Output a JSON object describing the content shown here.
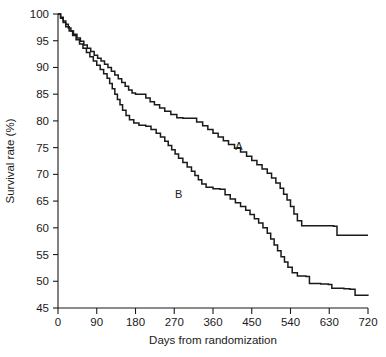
{
  "chart_data": {
    "type": "line",
    "title": "",
    "subtitle": "",
    "xlabel": "Days from randomization",
    "ylabel": "Survival rate (%)",
    "xlim": [
      0,
      720
    ],
    "ylim": [
      45,
      100
    ],
    "xticks": [
      0,
      90,
      180,
      270,
      360,
      450,
      540,
      630,
      720
    ],
    "yticks": [
      45,
      50,
      55,
      60,
      65,
      70,
      75,
      80,
      85,
      90,
      95,
      100
    ],
    "grid": false,
    "legend_position": "inline-annotation",
    "annotations": [
      {
        "text": "A",
        "x": 420,
        "y": 74.5
      },
      {
        "text": "B",
        "x": 280,
        "y": 65.5
      }
    ],
    "series": [
      {
        "name": "A",
        "label": "A",
        "style": "step-post",
        "color": "#1a1a1a",
        "points": [
          [
            0,
            100.0
          ],
          [
            6,
            99.4
          ],
          [
            12,
            98.7
          ],
          [
            18,
            98.1
          ],
          [
            24,
            97.4
          ],
          [
            30,
            96.8
          ],
          [
            36,
            96.2
          ],
          [
            44,
            95.5
          ],
          [
            52,
            94.9
          ],
          [
            60,
            94.2
          ],
          [
            68,
            93.6
          ],
          [
            76,
            93.0
          ],
          [
            84,
            92.3
          ],
          [
            92,
            91.7
          ],
          [
            100,
            91.2
          ],
          [
            108,
            90.6
          ],
          [
            116,
            90.0
          ],
          [
            124,
            89.3
          ],
          [
            132,
            88.6
          ],
          [
            140,
            87.9
          ],
          [
            148,
            87.2
          ],
          [
            156,
            86.5
          ],
          [
            164,
            85.8
          ],
          [
            172,
            85.2
          ],
          [
            180,
            85.0
          ],
          [
            196,
            85.0
          ],
          [
            204,
            84.3
          ],
          [
            214,
            83.6
          ],
          [
            224,
            83.0
          ],
          [
            236,
            82.4
          ],
          [
            248,
            81.8
          ],
          [
            262,
            81.2
          ],
          [
            276,
            80.6
          ],
          [
            290,
            80.5
          ],
          [
            310,
            80.5
          ],
          [
            322,
            79.8
          ],
          [
            336,
            79.1
          ],
          [
            348,
            78.4
          ],
          [
            360,
            77.7
          ],
          [
            372,
            77.0
          ],
          [
            384,
            76.3
          ],
          [
            396,
            75.6
          ],
          [
            410,
            74.9
          ],
          [
            424,
            74.2
          ],
          [
            438,
            73.4
          ],
          [
            450,
            72.6
          ],
          [
            462,
            71.8
          ],
          [
            474,
            71.0
          ],
          [
            486,
            70.2
          ],
          [
            496,
            69.3
          ],
          [
            506,
            68.4
          ],
          [
            516,
            67.4
          ],
          [
            524,
            66.3
          ],
          [
            532,
            65.2
          ],
          [
            540,
            64.0
          ],
          [
            548,
            62.6
          ],
          [
            556,
            61.3
          ],
          [
            566,
            60.4
          ],
          [
            600,
            60.4
          ],
          [
            640,
            60.3
          ],
          [
            648,
            58.6
          ],
          [
            720,
            58.6
          ]
        ]
      },
      {
        "name": "B",
        "label": "B",
        "style": "step-post",
        "color": "#1a1a1a",
        "points": [
          [
            0,
            100.0
          ],
          [
            6,
            99.2
          ],
          [
            12,
            98.4
          ],
          [
            18,
            97.6
          ],
          [
            26,
            96.8
          ],
          [
            34,
            96.0
          ],
          [
            42,
            95.2
          ],
          [
            50,
            94.4
          ],
          [
            58,
            93.6
          ],
          [
            66,
            92.8
          ],
          [
            74,
            92.0
          ],
          [
            82,
            91.2
          ],
          [
            90,
            90.4
          ],
          [
            98,
            89.6
          ],
          [
            106,
            88.8
          ],
          [
            114,
            88.0
          ],
          [
            120,
            87.0
          ],
          [
            126,
            86.0
          ],
          [
            132,
            85.0
          ],
          [
            138,
            84.0
          ],
          [
            144,
            83.0
          ],
          [
            150,
            82.0
          ],
          [
            158,
            81.0
          ],
          [
            166,
            80.2
          ],
          [
            176,
            79.6
          ],
          [
            188,
            79.2
          ],
          [
            204,
            79.0
          ],
          [
            216,
            78.4
          ],
          [
            228,
            77.7
          ],
          [
            238,
            77.0
          ],
          [
            248,
            76.2
          ],
          [
            256,
            75.4
          ],
          [
            264,
            74.6
          ],
          [
            272,
            73.8
          ],
          [
            280,
            73.0
          ],
          [
            290,
            72.2
          ],
          [
            300,
            71.4
          ],
          [
            310,
            70.6
          ],
          [
            318,
            69.8
          ],
          [
            326,
            69.0
          ],
          [
            334,
            68.2
          ],
          [
            344,
            67.6
          ],
          [
            360,
            67.3
          ],
          [
            376,
            67.2
          ],
          [
            388,
            66.2
          ],
          [
            400,
            65.4
          ],
          [
            412,
            64.7
          ],
          [
            424,
            64.0
          ],
          [
            436,
            63.3
          ],
          [
            446,
            62.5
          ],
          [
            456,
            61.7
          ],
          [
            466,
            60.9
          ],
          [
            476,
            60.0
          ],
          [
            486,
            59.0
          ],
          [
            494,
            57.9
          ],
          [
            502,
            56.8
          ],
          [
            510,
            55.7
          ],
          [
            518,
            54.6
          ],
          [
            526,
            53.6
          ],
          [
            534,
            52.6
          ],
          [
            544,
            51.6
          ],
          [
            556,
            51.0
          ],
          [
            576,
            50.9
          ],
          [
            584,
            49.6
          ],
          [
            610,
            49.5
          ],
          [
            628,
            49.4
          ],
          [
            636,
            48.7
          ],
          [
            664,
            48.6
          ],
          [
            678,
            48.5
          ],
          [
            690,
            47.4
          ],
          [
            720,
            47.3
          ]
        ]
      }
    ]
  }
}
